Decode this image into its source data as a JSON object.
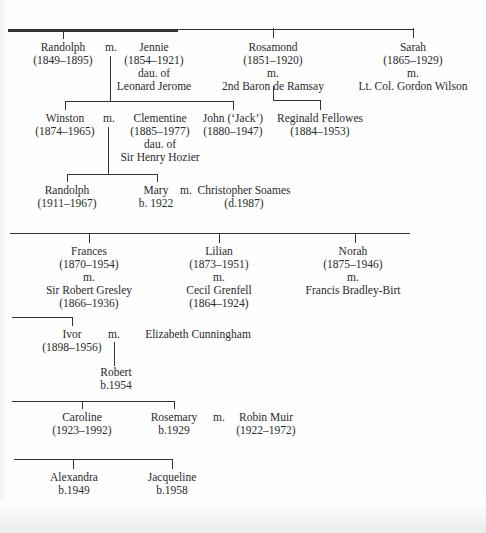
{
  "tree": {
    "marriage_marker": "m.",
    "generation_1": {
      "randolph": {
        "name": "Randolph",
        "dates": "(1849–1895)"
      },
      "jennie": {
        "name": "Jennie",
        "dates": "(1854–1921)",
        "note1": "dau. of",
        "note2": "Leonard Jerome"
      },
      "rosamond": {
        "name": "Rosamond",
        "dates": "(1851–1920)",
        "m": "m.",
        "spouse": "2nd Baron de Ramsay"
      },
      "sarah": {
        "name": "Sarah",
        "dates": "(1865–1929)",
        "m": "m.",
        "spouse": "Lt. Col. Gordon Wilson"
      }
    },
    "generation_2": {
      "winston": {
        "name": "Winston",
        "dates": "(1874–1965)"
      },
      "clementine": {
        "name": "Clementine",
        "dates": "(1885–1977)",
        "note1": "dau. of",
        "note2": "Sir Henry Hozier"
      },
      "john": {
        "name": "John (‘Jack’)",
        "dates": "(1880–1947)"
      },
      "reginald": {
        "name": "Reginald Fellowes",
        "dates": "(1884–1953)"
      }
    },
    "generation_3": {
      "randolph2": {
        "name": "Randolph",
        "dates": "(1911–1967)"
      },
      "mary": {
        "name": "Mary",
        "dates": "b. 1922"
      },
      "christopher": {
        "name": "Christopher Soames",
        "dates": "(d.1987)"
      }
    },
    "section_2": {
      "frances": {
        "name": "Frances",
        "dates": "(1870–1954)",
        "m": "m.",
        "spouse": "Sir Robert Gresley",
        "spouse_dates": "(1866–1936)"
      },
      "lilian": {
        "name": "Lilian",
        "dates": "(1873–1951)",
        "m": "m.",
        "spouse": "Cecil Grenfell",
        "spouse_dates": "(1864–1924)"
      },
      "norah": {
        "name": "Norah",
        "dates": "(1875–1946)",
        "m": "m.",
        "spouse": "Francis Bradley-Birt"
      }
    },
    "section_3": {
      "ivor": {
        "name": "Ivor",
        "dates": "(1898–1956)"
      },
      "elizabeth": {
        "name": "Elizabeth Cunningham"
      },
      "robert": {
        "name": "Robert",
        "dates": "b.1954"
      }
    },
    "section_4": {
      "caroline": {
        "name": "Caroline",
        "dates": "(1923–1992)"
      },
      "rosemary": {
        "name": "Rosemary",
        "dates": "b.1929"
      },
      "robin": {
        "name": "Robin Muir",
        "dates": "(1922–1972)"
      }
    },
    "section_5": {
      "alexandra": {
        "name": "Alexandra",
        "dates": "b.1949"
      },
      "jacqueline": {
        "name": "Jacqueline",
        "dates": "b.1958"
      }
    }
  }
}
